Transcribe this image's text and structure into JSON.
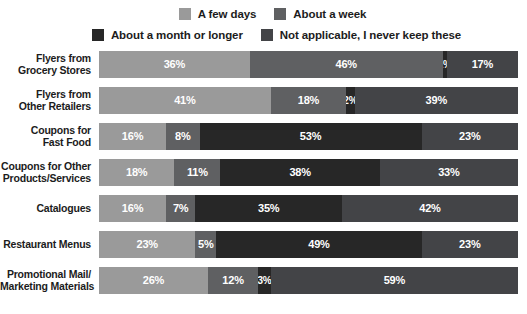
{
  "legend": {
    "rows": [
      [
        {
          "label": "A few days",
          "color": "#9a9a9a",
          "key": "a-few-days"
        },
        {
          "label": "About a week",
          "color": "#5f6062",
          "key": "about-a-week"
        }
      ],
      [
        {
          "label": "About a month or longer",
          "color": "#272727",
          "key": "about-a-month-or-longer"
        },
        {
          "label": "Not applicable, I never keep these",
          "color": "#434447",
          "key": "not-applicable"
        }
      ]
    ]
  },
  "chart_data": {
    "type": "bar",
    "title": "",
    "subtype": "stacked-horizontal-100pct",
    "xlabel": "",
    "ylabel": "",
    "xlim": [
      0,
      100
    ],
    "grid": false,
    "legend_position": "top",
    "value_suffix": "%",
    "categories": [
      "Flyers from Grocery Stores",
      "Flyers from Other Retailers",
      "Coupons for Fast Food",
      "Coupons for Other Products/Services",
      "Catalogues",
      "Restaurant Menus",
      "Promotional Mail/ Marketing Materials"
    ],
    "category_lines": [
      [
        "Flyers from",
        "Grocery Stores"
      ],
      [
        "Flyers from",
        "Other Retailers"
      ],
      [
        "Coupons for",
        "Fast Food"
      ],
      [
        "Coupons for Other",
        "Products/Services"
      ],
      [
        "Catalogues"
      ],
      [
        "Restaurant Menus"
      ],
      [
        "Promotional Mail/",
        "Marketing Materials"
      ]
    ],
    "series": [
      {
        "name": "A few days",
        "color": "#9a9a9a",
        "values": [
          36,
          41,
          16,
          18,
          16,
          23,
          26
        ]
      },
      {
        "name": "About a week",
        "color": "#5f6062",
        "values": [
          46,
          18,
          8,
          11,
          7,
          5,
          12
        ]
      },
      {
        "name": "About a month or longer",
        "color": "#272727",
        "values": [
          1,
          2,
          53,
          38,
          35,
          49,
          3
        ]
      },
      {
        "name": "Not applicable, I never keep these",
        "color": "#434447",
        "values": [
          17,
          39,
          23,
          33,
          42,
          23,
          59
        ]
      }
    ],
    "rows": [
      {
        "label": "Flyers from Grocery Stores",
        "segments": [
          {
            "series": "A few days",
            "value": 36,
            "text": "36%",
            "color": "#9a9a9a"
          },
          {
            "series": "About a week",
            "value": 46,
            "text": "46%",
            "color": "#5f6062"
          },
          {
            "series": "About a month or longer",
            "value": 1,
            "text": "1%",
            "color": "#272727"
          },
          {
            "series": "Not applicable, I never keep these",
            "value": 17,
            "text": "17%",
            "color": "#434447"
          }
        ]
      },
      {
        "label": "Flyers from Other Retailers",
        "segments": [
          {
            "series": "A few days",
            "value": 41,
            "text": "41%",
            "color": "#9a9a9a"
          },
          {
            "series": "About a week",
            "value": 18,
            "text": "18%",
            "color": "#5f6062"
          },
          {
            "series": "About a month or longer",
            "value": 2,
            "text": "2%",
            "color": "#272727"
          },
          {
            "series": "Not applicable, I never keep these",
            "value": 39,
            "text": "39%",
            "color": "#434447"
          }
        ]
      },
      {
        "label": "Coupons for Fast Food",
        "segments": [
          {
            "series": "A few days",
            "value": 16,
            "text": "16%",
            "color": "#9a9a9a"
          },
          {
            "series": "About a week",
            "value": 8,
            "text": "8%",
            "color": "#5f6062"
          },
          {
            "series": "About a month or longer",
            "value": 53,
            "text": "53%",
            "color": "#272727"
          },
          {
            "series": "Not applicable, I never keep these",
            "value": 23,
            "text": "23%",
            "color": "#434447"
          }
        ]
      },
      {
        "label": "Coupons for Other Products/Services",
        "segments": [
          {
            "series": "A few days",
            "value": 18,
            "text": "18%",
            "color": "#9a9a9a"
          },
          {
            "series": "About a week",
            "value": 11,
            "text": "11%",
            "color": "#5f6062"
          },
          {
            "series": "About a month or longer",
            "value": 38,
            "text": "38%",
            "color": "#272727"
          },
          {
            "series": "Not applicable, I never keep these",
            "value": 33,
            "text": "33%",
            "color": "#434447"
          }
        ]
      },
      {
        "label": "Catalogues",
        "segments": [
          {
            "series": "A few days",
            "value": 16,
            "text": "16%",
            "color": "#9a9a9a"
          },
          {
            "series": "About a week",
            "value": 7,
            "text": "7%",
            "color": "#5f6062"
          },
          {
            "series": "About a month or longer",
            "value": 35,
            "text": "35%",
            "color": "#272727"
          },
          {
            "series": "Not applicable, I never keep these",
            "value": 42,
            "text": "42%",
            "color": "#434447"
          }
        ]
      },
      {
        "label": "Restaurant Menus",
        "segments": [
          {
            "series": "A few days",
            "value": 23,
            "text": "23%",
            "color": "#9a9a9a"
          },
          {
            "series": "About a week",
            "value": 5,
            "text": "5%",
            "color": "#5f6062"
          },
          {
            "series": "About a month or longer",
            "value": 49,
            "text": "49%",
            "color": "#272727"
          },
          {
            "series": "Not applicable, I never keep these",
            "value": 23,
            "text": "23%",
            "color": "#434447"
          }
        ]
      },
      {
        "label": "Promotional Mail/ Marketing Materials",
        "segments": [
          {
            "series": "A few days",
            "value": 26,
            "text": "26%",
            "color": "#9a9a9a"
          },
          {
            "series": "About a week",
            "value": 12,
            "text": "12%",
            "color": "#5f6062"
          },
          {
            "series": "About a month or longer",
            "value": 3,
            "text": "3%",
            "color": "#272727"
          },
          {
            "series": "Not applicable, I never keep these",
            "value": 59,
            "text": "59%",
            "color": "#434447"
          }
        ]
      }
    ]
  }
}
